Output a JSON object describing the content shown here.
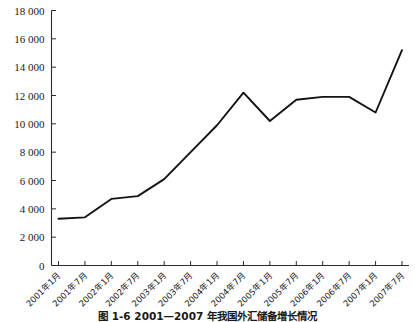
{
  "figure": {
    "caption": "图 1-6   2001—2007 年我国外汇储备增长情况"
  },
  "chart_data": {
    "type": "line",
    "title": "",
    "subtitle": "",
    "xlabel": "",
    "ylabel": "",
    "grid": false,
    "legend": "none",
    "ylim": [
      0,
      18000
    ],
    "ytick_step": 2000,
    "ytick_labels": [
      "18 000",
      "16 000",
      "14 000",
      "12 000",
      "10 000",
      "8 000",
      "6 000",
      "4 000",
      "2 000",
      "0"
    ],
    "ytick_values": [
      18000,
      16000,
      14000,
      12000,
      10000,
      8000,
      6000,
      4000,
      2000,
      0
    ],
    "categories": [
      "2001年1月",
      "2001年7月",
      "2002年1月",
      "2002年7月",
      "2003年1月",
      "2003年7月",
      "2004年1月",
      "2004年7月",
      "2005年1月",
      "2005年7月",
      "2006年1月",
      "2006年7月",
      "2007年1月",
      "2007年7月"
    ],
    "series": [
      {
        "name": "外汇储备",
        "values": [
          3300,
          3400,
          4700,
          4900,
          6100,
          8000,
          9900,
          12200,
          10200,
          11700,
          11900,
          11900,
          10800,
          15200
        ]
      }
    ]
  }
}
